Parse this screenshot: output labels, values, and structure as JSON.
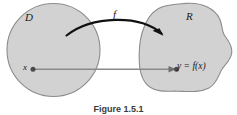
{
  "figure": {
    "caption": "Figure 1.5.1",
    "background_color": "#ffffff",
    "set_fill_color": "#d2d2d2",
    "set_stroke_color": "#8c8c8c",
    "arrow_color": "#111111",
    "map_line_color": "#8a8a8a",
    "text_color": "#1a1a1a"
  },
  "sets": {
    "domain": {
      "label": "D",
      "shape": "circle"
    },
    "range": {
      "label": "R",
      "shape": "blob"
    }
  },
  "mapping": {
    "function_label": "f",
    "input_label": "x",
    "output_label": "y = f(x)"
  }
}
